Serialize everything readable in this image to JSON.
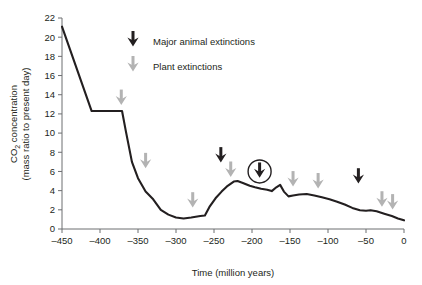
{
  "chart_data": {
    "type": "line",
    "title": "",
    "xlabel": "Time (million years)",
    "ylabel_line1": "CO2 concentration",
    "ylabel_line2": "(mass ratio to present day)",
    "ylabel_main": "CO",
    "ylabel_sub": "2",
    "ylabel_rest": " concentration",
    "xlim": [
      -450,
      0
    ],
    "ylim": [
      0,
      22
    ],
    "grid": false,
    "legend_position": "top-center",
    "xticks": [
      -450,
      -400,
      -350,
      -300,
      -250,
      -200,
      -150,
      -100,
      -50,
      0
    ],
    "xtick_labels": [
      "-450",
      "-400",
      "-350",
      "-300",
      "-250",
      "-200",
      "-150",
      "-100",
      "-50",
      "0"
    ],
    "yticks": [
      0,
      2,
      4,
      6,
      8,
      10,
      12,
      14,
      16,
      18,
      20,
      22
    ],
    "ytick_labels": [
      "0",
      "2",
      "4",
      "6",
      "8",
      "10",
      "12",
      "14",
      "16",
      "18",
      "20",
      "22"
    ],
    "series": [
      {
        "name": "CO2 concentration",
        "color": "#231f20",
        "x": [
          -450,
          -411,
          -371,
          -366,
          -358,
          -350,
          -340,
          -330,
          -320,
          -310,
          -300,
          -290,
          -280,
          -268,
          -262,
          -256,
          -248,
          -240,
          -232,
          -224,
          -219,
          -212,
          -203,
          -196,
          -188,
          -180,
          -174,
          -168,
          -163,
          -158,
          -152,
          -146,
          -138,
          -128,
          -118,
          -108,
          -98,
          -88,
          -78,
          -68,
          -58,
          -50,
          -44,
          -36,
          -26,
          -16,
          -8,
          0
        ],
        "y": [
          21.1,
          12.3,
          12.3,
          10.2,
          7.0,
          5.3,
          3.9,
          3.1,
          2.0,
          1.5,
          1.2,
          1.1,
          1.2,
          1.35,
          1.4,
          2.3,
          3.2,
          3.9,
          4.5,
          4.95,
          5.0,
          4.8,
          4.5,
          4.35,
          4.2,
          4.1,
          3.95,
          4.35,
          4.6,
          3.9,
          3.4,
          3.5,
          3.6,
          3.65,
          3.5,
          3.3,
          3.1,
          2.85,
          2.55,
          2.2,
          1.95,
          1.9,
          1.95,
          1.85,
          1.6,
          1.35,
          1.1,
          0.9
        ]
      }
    ],
    "annotations": [
      {
        "kind": "plant-extinction-arrow",
        "x": -372,
        "y": 13.6,
        "color": "#b3b3b3",
        "circled": false
      },
      {
        "kind": "plant-extinction-arrow",
        "x": -340,
        "y": 7.0,
        "color": "#b3b3b3",
        "circled": false
      },
      {
        "kind": "plant-extinction-arrow",
        "x": -278,
        "y": 2.9,
        "color": "#b3b3b3",
        "circled": false
      },
      {
        "kind": "animal-extinction-arrow",
        "x": -241,
        "y": 7.6,
        "color": "#231f20",
        "circled": false
      },
      {
        "kind": "plant-extinction-arrow",
        "x": -228,
        "y": 6.1,
        "color": "#b3b3b3",
        "circled": false
      },
      {
        "kind": "animal-extinction-arrow",
        "x": -190,
        "y": 6.0,
        "color": "#231f20",
        "circled": true
      },
      {
        "kind": "plant-extinction-arrow",
        "x": -146,
        "y": 5.1,
        "color": "#b3b3b3",
        "circled": false
      },
      {
        "kind": "plant-extinction-arrow",
        "x": -113,
        "y": 4.9,
        "color": "#b3b3b3",
        "circled": false
      },
      {
        "kind": "animal-extinction-arrow",
        "x": -60,
        "y": 5.4,
        "color": "#231f20",
        "circled": false
      },
      {
        "kind": "plant-extinction-arrow",
        "x": -29,
        "y": 3.0,
        "color": "#b3b3b3",
        "circled": false
      },
      {
        "kind": "plant-extinction-arrow",
        "x": -15,
        "y": 2.7,
        "color": "#b3b3b3",
        "circled": false
      }
    ],
    "legend": [
      {
        "label": "Major animal extinctions",
        "color": "#231f20"
      },
      {
        "label": "Plant extinctions",
        "color": "#b3b3b3"
      }
    ]
  },
  "colors": {
    "curve": "#231f20",
    "axis": "#6d6e71",
    "animal_arrow": "#231f20",
    "plant_arrow": "#b3b3b3",
    "text": "#231f20",
    "background": "#ffffff"
  }
}
